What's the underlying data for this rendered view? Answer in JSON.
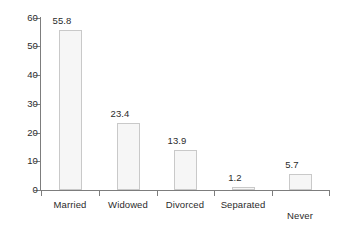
{
  "chart_data": {
    "type": "bar",
    "title": "",
    "subtitle": "",
    "xlabel": "",
    "ylabel": "",
    "categories": [
      "Married",
      "Widowed",
      "Divorced",
      "Separated",
      "Never married"
    ],
    "category_lines": [
      [
        "Married"
      ],
      [
        "Widowed"
      ],
      [
        "Divorced"
      ],
      [
        "Separated"
      ],
      [
        "Never",
        "married"
      ]
    ],
    "values": [
      55.8,
      23.4,
      13.9,
      1.2,
      5.7
    ],
    "value_labels": [
      "55.8",
      "23.4",
      "13.9",
      "1.2",
      "5.7"
    ],
    "ylim": [
      0,
      60
    ],
    "yticks": [
      0,
      10,
      20,
      30,
      40,
      50,
      60
    ],
    "ytick_labels": [
      "0",
      "10",
      "20",
      "30",
      "40",
      "50",
      "60"
    ],
    "grid": false,
    "legend": null,
    "legend_position": "none",
    "orientation": "vertical"
  },
  "style": {
    "bar_fill": "#f6f6f6",
    "bar_border": "#c9c9c9",
    "axis_color": "#7d7d7d",
    "text_color": "#2b2b2b",
    "background": "#ffffff"
  }
}
